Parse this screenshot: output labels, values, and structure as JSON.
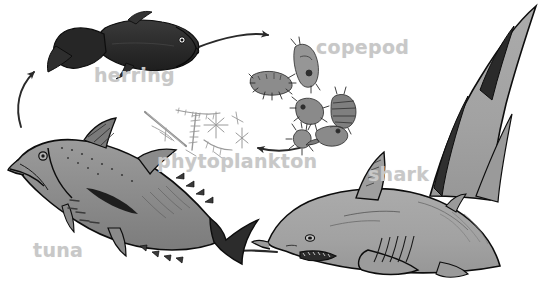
{
  "diagram": {
    "background_color": "#ffffff",
    "label_color": "#c8c8c8",
    "width": 539,
    "height": 285,
    "labels": [
      {
        "id": "herring",
        "text": "herring",
        "x": 94,
        "y": 66
      },
      {
        "id": "copepod",
        "text": "copepod",
        "x": 316,
        "y": 38
      },
      {
        "id": "phytoplankton",
        "text": "phytoplankton",
        "x": 157,
        "y": 152
      },
      {
        "id": "tuna",
        "text": "tuna",
        "x": 33,
        "y": 241
      },
      {
        "id": "shark",
        "text": "shark",
        "x": 368,
        "y": 165
      }
    ],
    "organisms": [
      {
        "id": "herring",
        "name": "herring",
        "kind": "fish",
        "fill": "#2b2b2b",
        "outline": "#111111"
      },
      {
        "id": "copepod",
        "name": "copepod",
        "kind": "crustaceans",
        "fill": "#8f8f8f",
        "outline": "#2a2a2a",
        "count": 6
      },
      {
        "id": "phytoplankton",
        "name": "phytoplankton",
        "kind": "diatoms",
        "fill": "none",
        "outline": "#9a9a9a"
      },
      {
        "id": "tuna",
        "name": "tuna",
        "kind": "fish",
        "fill": "#8a8a8a",
        "outline": "#0d0d0d"
      },
      {
        "id": "shark",
        "name": "shark",
        "kind": "shark",
        "fill": "#a2a2a2",
        "outline": "#0d0d0d"
      }
    ],
    "arrows": [
      {
        "id": "tuna-to-herring",
        "from": "tuna",
        "to": "herring",
        "direction": "up-left-curve",
        "color": "#2a2a2a"
      },
      {
        "id": "herring-to-copepod",
        "from": "herring",
        "to": "copepod",
        "direction": "right",
        "color": "#2a2a2a"
      },
      {
        "id": "copepod-to-phytoplankton",
        "from": "copepod",
        "to": "phytoplankton",
        "direction": "left",
        "color": "#2a2a2a"
      },
      {
        "id": "shark-to-tuna",
        "from": "shark",
        "to": "tuna",
        "direction": "left",
        "color": "#2a2a2a"
      }
    ]
  }
}
